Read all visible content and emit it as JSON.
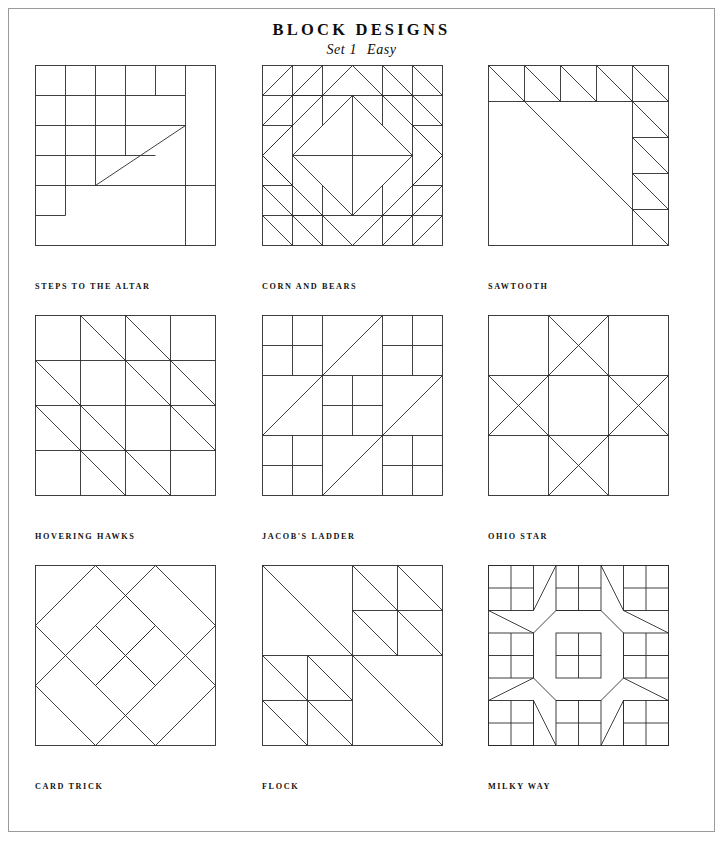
{
  "page": {
    "title": "BLOCK DESIGNS",
    "subtitle_set": "Set 1",
    "subtitle_level": "Easy",
    "border_color": "#9a9a9a",
    "ink_color": "#2a2a2a",
    "background_color": "#ffffff"
  },
  "blocks": [
    {
      "id": "steps-to-the-altar",
      "label": "STEPS TO THE ALTAR",
      "grid": 6,
      "row": 1,
      "column": 1,
      "description": "Six-by-six pieced block: stepped rails along the top and left, a large right triangle stepping from lower-left to upper-right, and large plain squares filling the lower right."
    },
    {
      "id": "corn-and-bears",
      "label": "CORN AND BEARS",
      "grid": 6,
      "row": 1,
      "column": 2,
      "description": "Concentric on-point squares with half-square triangle bear's paw corners; a large diamond centered in a six-by-six grid."
    },
    {
      "id": "sawtooth",
      "label": "SAWTOOTH",
      "grid": 5,
      "row": 1,
      "column": 3,
      "description": "One large corner-to-corner triangle with a sawtooth border of small half-square triangles along the top edge and the right edge."
    },
    {
      "id": "hovering-hawks",
      "label": "HOVERING HAWKS",
      "grid": 4,
      "row": 2,
      "column": 1,
      "description": "Four-by-four grid with parallel diagonals running from upper-left to lower-right, forming stepped hawk shapes."
    },
    {
      "id": "jacobs-ladder",
      "label": "JACOB'S LADDER",
      "grid": 3,
      "row": 2,
      "column": 2,
      "description": "Nine-patch of alternating four-patch corner units and half-square triangle units forming a ladder diagonal."
    },
    {
      "id": "ohio-star",
      "label": "OHIO STAR",
      "grid": 3,
      "row": 2,
      "column": 3,
      "description": "Classic nine-patch star: plain corner squares, quarter-square triangle points on each side, and a plain center."
    },
    {
      "id": "card-trick",
      "label": "CARD TRICK",
      "grid": 3,
      "row": 3,
      "column": 1,
      "description": "Three interlocking on-point squares resembling overlapping playing cards."
    },
    {
      "id": "flock",
      "label": "FLOCK",
      "grid": 4,
      "row": 3,
      "column": 2,
      "description": "Nested half-square triangles in decreasing sizes, repeated like a flock of birds in flight."
    },
    {
      "id": "milky-way",
      "label": "MILKY WAY",
      "grid": 6,
      "row": 3,
      "column": 3,
      "description": "Nine four-patch squares at the intersections with an interlocking star-and-cross field of diagonals between them."
    }
  ]
}
